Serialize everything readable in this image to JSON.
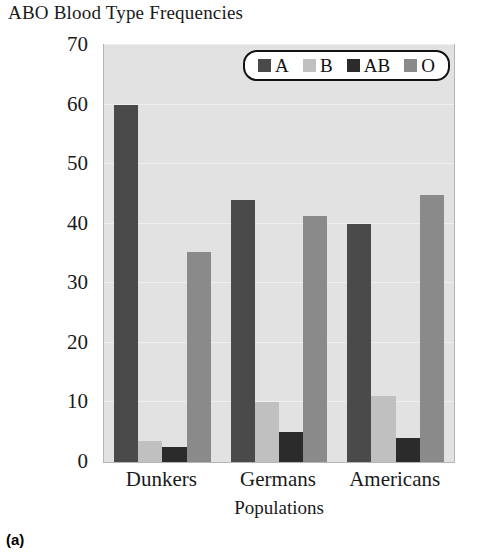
{
  "figure": {
    "title": "ABO Blood Type Frequencies",
    "caption": "(a)"
  },
  "colors": {
    "A": "#4a4a4a",
    "B": "#c0c0c0",
    "AB": "#2b2b2b",
    "O": "#8a8a8a",
    "plot_background": "#e2e2e2",
    "frame": "#b5b5b5",
    "text": "#1a1a1a"
  },
  "chart_data": {
    "type": "bar",
    "title": "ABO Blood Type Frequencies",
    "xlabel": "Populations",
    "ylabel": "Percentage",
    "categories": [
      "Dunkers",
      "Germans",
      "Americans"
    ],
    "series": [
      {
        "name": "A",
        "color": "#4a4a4a",
        "values": [
          60.0,
          44.0,
          40.0
        ]
      },
      {
        "name": "B",
        "color": "#c0c0c0",
        "values": [
          3.5,
          10.0,
          11.0
        ]
      },
      {
        "name": "AB",
        "color": "#2b2b2b",
        "values": [
          2.5,
          5.0,
          4.0
        ]
      },
      {
        "name": "O",
        "color": "#8a8a8a",
        "values": [
          35.2,
          41.3,
          44.8
        ]
      }
    ],
    "ylim": [
      0,
      70
    ],
    "yticks": [
      0,
      10,
      20,
      30,
      40,
      50,
      60,
      70
    ],
    "ytick_labels": [
      "0",
      "10",
      "20",
      "30",
      "40",
      "50",
      "60",
      "70"
    ],
    "grid": true,
    "legend": {
      "position": "top-right-inside",
      "entries": [
        "A",
        "B",
        "AB",
        "O"
      ]
    }
  }
}
